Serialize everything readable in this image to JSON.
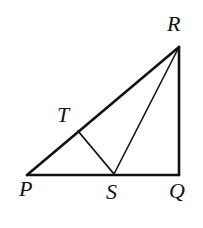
{
  "figure": {
    "kind": "geometry-diagram",
    "canvas": {
      "width": 203,
      "height": 228,
      "background": "#ffffff"
    },
    "stroke_color": "#111111",
    "points": [
      {
        "id": "P",
        "label": "P",
        "x": 27,
        "y": 175
      },
      {
        "id": "Q",
        "label": "Q",
        "x": 179,
        "y": 175
      },
      {
        "id": "R",
        "label": "R",
        "x": 179,
        "y": 47
      },
      {
        "id": "S",
        "label": "S",
        "x": 114,
        "y": 174
      },
      {
        "id": "T",
        "label": "T",
        "x": 78,
        "y": 131
      }
    ],
    "segments": [
      {
        "id": "PQ",
        "from": "P",
        "to": "Q",
        "width": 2.6
      },
      {
        "id": "QR",
        "from": "Q",
        "to": "R",
        "width": 2.6
      },
      {
        "id": "PR",
        "from": "P",
        "to": "R",
        "width": 2.6
      },
      {
        "id": "SR",
        "from": "S",
        "to": "R",
        "width": 1.6
      },
      {
        "id": "TS",
        "from": "T",
        "to": "S",
        "width": 1.8
      }
    ],
    "labels": {
      "P": "P",
      "Q": "Q",
      "R": "R",
      "S": "S",
      "T": "T"
    }
  }
}
